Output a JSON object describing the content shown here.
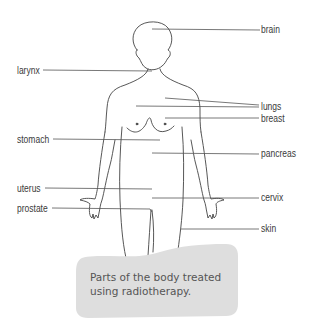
{
  "diagram": {
    "labels": {
      "brain": "brain",
      "larynx": "larynx",
      "lungs": "lungs",
      "breast": "breast",
      "stomach": "stomach",
      "pancreas": "pancreas",
      "uterus": "uterus",
      "cervix": "cervix",
      "prostate": "prostate",
      "skin": "skin"
    },
    "caption": {
      "line1": "Parts of the body treated",
      "line2": "using radiotherapy."
    },
    "colors": {
      "outline": "#444444",
      "leader_line": "#555555",
      "caption_bg": "#dedede",
      "text": "#3a3a3a"
    }
  }
}
